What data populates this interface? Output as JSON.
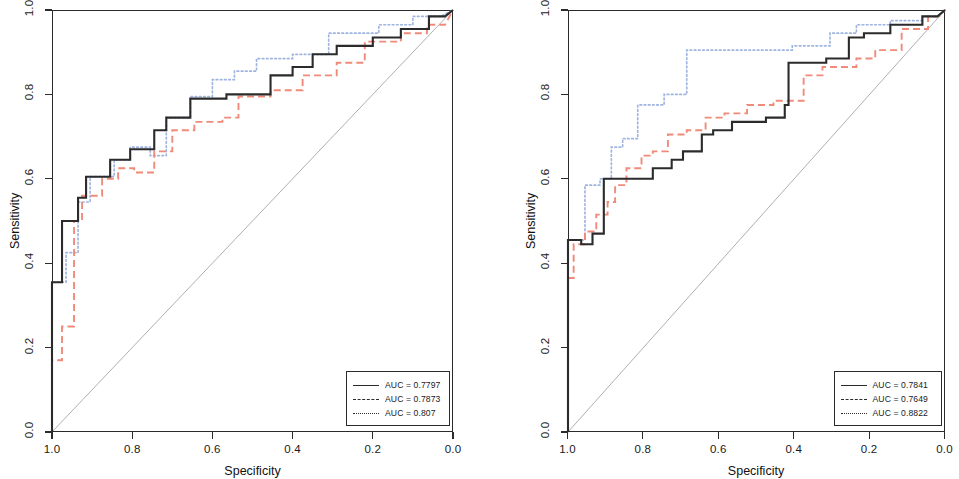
{
  "figure": {
    "panels": [
      {
        "id": "left-panel",
        "axes": {
          "xlabel": "Specificity",
          "ylabel": "Sensitivity",
          "xticks": [
            "1.0",
            "0.8",
            "0.6",
            "0.4",
            "0.2",
            "0.0"
          ],
          "yticks": [
            "0.0",
            "0.2",
            "0.4",
            "0.6",
            "0.8",
            "1.0"
          ]
        },
        "legend": {
          "items": [
            {
              "label": "AUC = 0.7797",
              "style": "solid"
            },
            {
              "label": "AUC = 0.7873",
              "style": "dashed"
            },
            {
              "label": "AUC = 0.807",
              "style": "dotted"
            }
          ]
        }
      },
      {
        "id": "right-panel",
        "axes": {
          "xlabel": "Specificity",
          "ylabel": "Sensitivity",
          "xticks": [
            "1.0",
            "0.8",
            "0.6",
            "0.4",
            "0.2",
            "0.0"
          ],
          "yticks": [
            "0.0",
            "0.2",
            "0.4",
            "0.6",
            "0.8",
            "1.0"
          ]
        },
        "legend": {
          "items": [
            {
              "label": "AUC = 0.7841",
              "style": "solid"
            },
            {
              "label": "AUC = 0.7649",
              "style": "dashed"
            },
            {
              "label": "AUC = 0.8822",
              "style": "dotted"
            }
          ]
        }
      }
    ]
  },
  "colors": {
    "solid": "#2b2b2b",
    "dashed": "#f08a7a",
    "dotted": "#9fb4e0",
    "diagonal": "#9a9a9a",
    "axis": "#2b2b2b"
  },
  "chart_data": [
    {
      "type": "line",
      "title": "",
      "xlabel": "Specificity",
      "ylabel": "Sensitivity",
      "xlim": [
        1.0,
        0.0
      ],
      "ylim": [
        0.0,
        1.0
      ],
      "x_reversed": true,
      "grid": false,
      "legend_position": "bottom-right",
      "xticks": [
        1.0,
        0.8,
        0.6,
        0.4,
        0.2,
        0.0
      ],
      "yticks": [
        0.0,
        0.2,
        0.4,
        0.6,
        0.8,
        1.0
      ],
      "reference_line": {
        "from": [
          1.0,
          0.0
        ],
        "to": [
          0.0,
          1.0
        ]
      },
      "series": [
        {
          "name": "AUC = 0.7797",
          "style": "solid",
          "auc": 0.7797,
          "points": [
            [
              1.0,
              0.0
            ],
            [
              1.0,
              0.355
            ],
            [
              0.975,
              0.355
            ],
            [
              0.975,
              0.5
            ],
            [
              0.935,
              0.5
            ],
            [
              0.935,
              0.555
            ],
            [
              0.915,
              0.555
            ],
            [
              0.915,
              0.605
            ],
            [
              0.855,
              0.605
            ],
            [
              0.855,
              0.645
            ],
            [
              0.805,
              0.645
            ],
            [
              0.805,
              0.67
            ],
            [
              0.745,
              0.67
            ],
            [
              0.745,
              0.715
            ],
            [
              0.715,
              0.715
            ],
            [
              0.715,
              0.745
            ],
            [
              0.655,
              0.745
            ],
            [
              0.655,
              0.79
            ],
            [
              0.565,
              0.79
            ],
            [
              0.565,
              0.8
            ],
            [
              0.455,
              0.8
            ],
            [
              0.455,
              0.845
            ],
            [
              0.4,
              0.845
            ],
            [
              0.4,
              0.865
            ],
            [
              0.35,
              0.865
            ],
            [
              0.35,
              0.895
            ],
            [
              0.29,
              0.895
            ],
            [
              0.29,
              0.915
            ],
            [
              0.2,
              0.915
            ],
            [
              0.2,
              0.935
            ],
            [
              0.13,
              0.935
            ],
            [
              0.13,
              0.955
            ],
            [
              0.06,
              0.955
            ],
            [
              0.06,
              0.985
            ],
            [
              0.02,
              0.985
            ],
            [
              0.0,
              1.0
            ]
          ]
        },
        {
          "name": "AUC = 0.7873",
          "style": "dashed",
          "auc": 0.7873,
          "points": [
            [
              1.0,
              0.0
            ],
            [
              1.0,
              0.17
            ],
            [
              0.975,
              0.17
            ],
            [
              0.975,
              0.25
            ],
            [
              0.945,
              0.25
            ],
            [
              0.945,
              0.5
            ],
            [
              0.925,
              0.5
            ],
            [
              0.925,
              0.56
            ],
            [
              0.875,
              0.56
            ],
            [
              0.875,
              0.6
            ],
            [
              0.835,
              0.6
            ],
            [
              0.835,
              0.625
            ],
            [
              0.795,
              0.625
            ],
            [
              0.795,
              0.615
            ],
            [
              0.745,
              0.615
            ],
            [
              0.745,
              0.665
            ],
            [
              0.7,
              0.665
            ],
            [
              0.7,
              0.715
            ],
            [
              0.645,
              0.715
            ],
            [
              0.645,
              0.735
            ],
            [
              0.575,
              0.735
            ],
            [
              0.575,
              0.745
            ],
            [
              0.535,
              0.745
            ],
            [
              0.535,
              0.795
            ],
            [
              0.455,
              0.795
            ],
            [
              0.455,
              0.81
            ],
            [
              0.375,
              0.81
            ],
            [
              0.375,
              0.845
            ],
            [
              0.29,
              0.845
            ],
            [
              0.29,
              0.875
            ],
            [
              0.22,
              0.875
            ],
            [
              0.22,
              0.925
            ],
            [
              0.13,
              0.925
            ],
            [
              0.13,
              0.945
            ],
            [
              0.065,
              0.945
            ],
            [
              0.065,
              0.965
            ],
            [
              0.02,
              0.965
            ],
            [
              0.0,
              1.0
            ]
          ]
        },
        {
          "name": "AUC = 0.807",
          "style": "dotted",
          "auc": 0.807,
          "points": [
            [
              1.0,
              0.0
            ],
            [
              1.0,
              0.355
            ],
            [
              0.965,
              0.355
            ],
            [
              0.965,
              0.425
            ],
            [
              0.935,
              0.425
            ],
            [
              0.935,
              0.545
            ],
            [
              0.905,
              0.545
            ],
            [
              0.905,
              0.605
            ],
            [
              0.845,
              0.605
            ],
            [
              0.845,
              0.645
            ],
            [
              0.805,
              0.645
            ],
            [
              0.805,
              0.675
            ],
            [
              0.755,
              0.675
            ],
            [
              0.755,
              0.655
            ],
            [
              0.715,
              0.655
            ],
            [
              0.715,
              0.745
            ],
            [
              0.655,
              0.745
            ],
            [
              0.655,
              0.795
            ],
            [
              0.6,
              0.795
            ],
            [
              0.6,
              0.835
            ],
            [
              0.545,
              0.835
            ],
            [
              0.545,
              0.855
            ],
            [
              0.49,
              0.855
            ],
            [
              0.49,
              0.885
            ],
            [
              0.4,
              0.885
            ],
            [
              0.4,
              0.895
            ],
            [
              0.31,
              0.895
            ],
            [
              0.31,
              0.945
            ],
            [
              0.185,
              0.945
            ],
            [
              0.185,
              0.965
            ],
            [
              0.1,
              0.965
            ],
            [
              0.1,
              0.985
            ],
            [
              0.03,
              0.985
            ],
            [
              0.0,
              1.0
            ]
          ]
        }
      ]
    },
    {
      "type": "line",
      "title": "",
      "xlabel": "Specificity",
      "ylabel": "Sensitivity",
      "xlim": [
        1.0,
        0.0
      ],
      "ylim": [
        0.0,
        1.0
      ],
      "x_reversed": true,
      "grid": false,
      "legend_position": "bottom-right",
      "xticks": [
        1.0,
        0.8,
        0.6,
        0.4,
        0.2,
        0.0
      ],
      "yticks": [
        0.0,
        0.2,
        0.4,
        0.6,
        0.8,
        1.0
      ],
      "reference_line": {
        "from": [
          1.0,
          0.0
        ],
        "to": [
          0.0,
          1.0
        ]
      },
      "series": [
        {
          "name": "AUC = 0.7841",
          "style": "solid",
          "auc": 0.7841,
          "points": [
            [
              1.0,
              0.0
            ],
            [
              1.0,
              0.455
            ],
            [
              0.965,
              0.455
            ],
            [
              0.965,
              0.445
            ],
            [
              0.935,
              0.445
            ],
            [
              0.935,
              0.47
            ],
            [
              0.905,
              0.47
            ],
            [
              0.905,
              0.6
            ],
            [
              0.775,
              0.6
            ],
            [
              0.775,
              0.625
            ],
            [
              0.725,
              0.625
            ],
            [
              0.725,
              0.645
            ],
            [
              0.695,
              0.645
            ],
            [
              0.695,
              0.665
            ],
            [
              0.645,
              0.665
            ],
            [
              0.645,
              0.705
            ],
            [
              0.615,
              0.705
            ],
            [
              0.615,
              0.715
            ],
            [
              0.565,
              0.715
            ],
            [
              0.565,
              0.735
            ],
            [
              0.475,
              0.735
            ],
            [
              0.475,
              0.745
            ],
            [
              0.425,
              0.745
            ],
            [
              0.425,
              0.775
            ],
            [
              0.415,
              0.775
            ],
            [
              0.415,
              0.875
            ],
            [
              0.315,
              0.875
            ],
            [
              0.315,
              0.885
            ],
            [
              0.255,
              0.885
            ],
            [
              0.255,
              0.935
            ],
            [
              0.215,
              0.935
            ],
            [
              0.215,
              0.945
            ],
            [
              0.145,
              0.945
            ],
            [
              0.145,
              0.965
            ],
            [
              0.06,
              0.965
            ],
            [
              0.06,
              0.985
            ],
            [
              0.02,
              0.985
            ],
            [
              0.0,
              1.0
            ]
          ]
        },
        {
          "name": "AUC = 0.7649",
          "style": "dashed",
          "auc": 0.7649,
          "points": [
            [
              1.0,
              0.0
            ],
            [
              1.0,
              0.365
            ],
            [
              0.985,
              0.365
            ],
            [
              0.985,
              0.445
            ],
            [
              0.955,
              0.445
            ],
            [
              0.955,
              0.475
            ],
            [
              0.925,
              0.475
            ],
            [
              0.925,
              0.515
            ],
            [
              0.895,
              0.515
            ],
            [
              0.895,
              0.545
            ],
            [
              0.875,
              0.545
            ],
            [
              0.875,
              0.585
            ],
            [
              0.845,
              0.585
            ],
            [
              0.845,
              0.625
            ],
            [
              0.805,
              0.625
            ],
            [
              0.805,
              0.655
            ],
            [
              0.775,
              0.655
            ],
            [
              0.775,
              0.665
            ],
            [
              0.735,
              0.665
            ],
            [
              0.735,
              0.705
            ],
            [
              0.685,
              0.705
            ],
            [
              0.685,
              0.715
            ],
            [
              0.635,
              0.715
            ],
            [
              0.635,
              0.745
            ],
            [
              0.585,
              0.745
            ],
            [
              0.585,
              0.755
            ],
            [
              0.525,
              0.755
            ],
            [
              0.525,
              0.775
            ],
            [
              0.455,
              0.775
            ],
            [
              0.455,
              0.785
            ],
            [
              0.415,
              0.785
            ],
            [
              0.415,
              0.785
            ],
            [
              0.375,
              0.785
            ],
            [
              0.375,
              0.845
            ],
            [
              0.325,
              0.845
            ],
            [
              0.325,
              0.865
            ],
            [
              0.235,
              0.865
            ],
            [
              0.235,
              0.885
            ],
            [
              0.185,
              0.885
            ],
            [
              0.185,
              0.905
            ],
            [
              0.115,
              0.905
            ],
            [
              0.115,
              0.955
            ],
            [
              0.045,
              0.955
            ],
            [
              0.045,
              0.985
            ],
            [
              0.015,
              0.985
            ],
            [
              0.0,
              1.0
            ]
          ]
        },
        {
          "name": "AUC = 0.8822",
          "style": "dotted",
          "auc": 0.8822,
          "points": [
            [
              1.0,
              0.0
            ],
            [
              1.0,
              0.455
            ],
            [
              0.955,
              0.455
            ],
            [
              0.955,
              0.585
            ],
            [
              0.915,
              0.585
            ],
            [
              0.915,
              0.6
            ],
            [
              0.885,
              0.6
            ],
            [
              0.885,
              0.675
            ],
            [
              0.855,
              0.675
            ],
            [
              0.855,
              0.695
            ],
            [
              0.815,
              0.695
            ],
            [
              0.815,
              0.775
            ],
            [
              0.745,
              0.775
            ],
            [
              0.745,
              0.8
            ],
            [
              0.685,
              0.8
            ],
            [
              0.685,
              0.905
            ],
            [
              0.405,
              0.905
            ],
            [
              0.405,
              0.915
            ],
            [
              0.305,
              0.915
            ],
            [
              0.305,
              0.945
            ],
            [
              0.235,
              0.945
            ],
            [
              0.235,
              0.965
            ],
            [
              0.145,
              0.965
            ],
            [
              0.145,
              0.975
            ],
            [
              0.06,
              0.975
            ],
            [
              0.06,
              0.985
            ],
            [
              0.02,
              0.985
            ],
            [
              0.0,
              1.0
            ]
          ]
        }
      ]
    }
  ]
}
